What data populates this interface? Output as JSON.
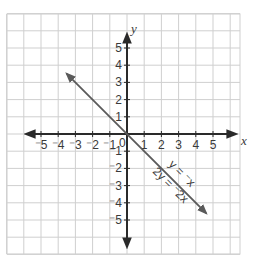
{
  "graph": {
    "axes": {
      "x_label": "x",
      "y_label": "y",
      "origin_label": "0",
      "x_ticks": [
        "⁻5",
        "⁻4",
        "⁻3",
        "⁻2",
        "⁻1",
        "1",
        "2",
        "3",
        "4",
        "5"
      ],
      "y_ticks_positive": [
        "5",
        "4",
        "3",
        "2",
        "1"
      ],
      "y_ticks_negative": [
        "⁻1",
        "⁻2",
        "⁻3",
        "⁻4",
        "⁻5"
      ]
    },
    "line": {
      "label_1": "y = ⁻x",
      "label_2": "2y = ⁻2x",
      "color": "#5a5a5a",
      "from": [
        -3.5,
        3.5
      ],
      "to": [
        4.6,
        -4.6
      ]
    },
    "grid": {
      "range_x": [
        -7,
        6.5
      ],
      "range_y": [
        -6.9,
        7.0
      ],
      "color": "#cfcfcf",
      "axis_color": "#2a2a2a"
    }
  }
}
